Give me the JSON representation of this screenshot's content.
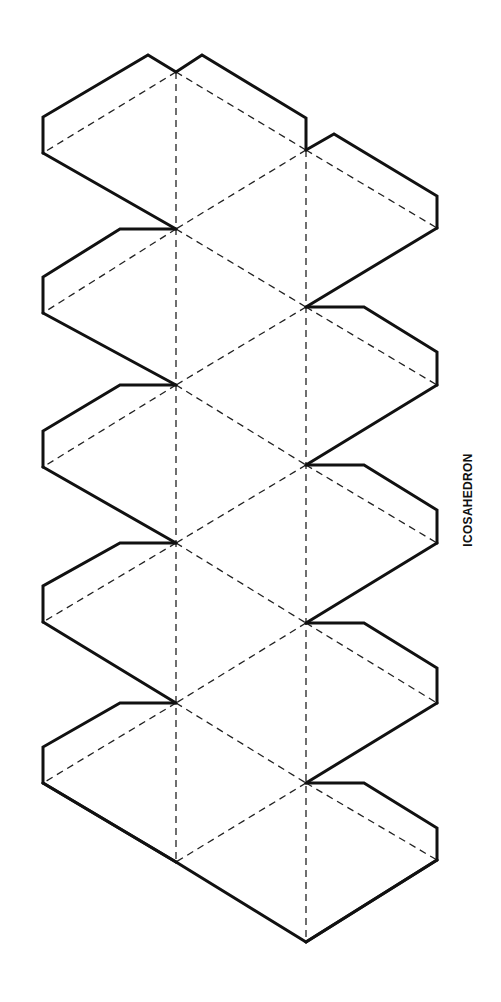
{
  "title": "ICOSAHEDRON",
  "diagram": {
    "type": "polyhedron-net",
    "shape": "icosahedron",
    "faces": 20,
    "glue_tabs": 10,
    "line_styles": {
      "cut": "solid",
      "fold": "dashed"
    },
    "colors": {
      "line": "#111111",
      "background": "#ffffff"
    }
  }
}
